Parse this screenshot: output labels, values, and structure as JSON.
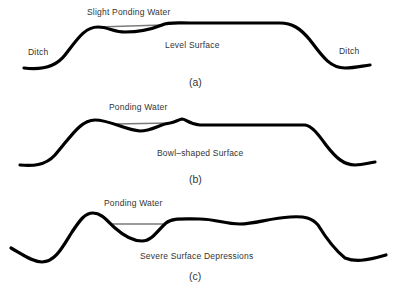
{
  "panels": [
    {
      "id": "a",
      "caption": "(a)",
      "water_label": "Slight Ponding Water",
      "surface_label": "Level Surface",
      "left_label": "Ditch",
      "right_label": "Ditch"
    },
    {
      "id": "b",
      "caption": "(b)",
      "water_label": "Ponding Water",
      "surface_label": "Bowl–shaped Surface"
    },
    {
      "id": "c",
      "caption": "(c)",
      "water_label": "Ponding Water",
      "surface_label": "Severe Surface Depressions"
    }
  ],
  "colors": {
    "ground_line": "#000000",
    "water_line": "#7a7a7a",
    "text": "#333333",
    "background": "#ffffff"
  }
}
